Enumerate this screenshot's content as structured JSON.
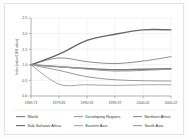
{
  "chart_data": {
    "type": "line",
    "title": "",
    "subtitle": "",
    "xlabel": "",
    "ylabel": "Index (value/1969 value)",
    "categories": [
      "1969-71",
      "1979-81",
      "1990-92",
      "1995-97",
      "2000-02",
      "2005-07"
    ],
    "xtick_labels": [
      "1969-71",
      "1979-81",
      "1990-92",
      "1995-97",
      "2000-02",
      "2005-07"
    ],
    "ytick_labels": [
      "0.0",
      "0.5",
      "1.0",
      "1.5",
      "2.0",
      "2.5"
    ],
    "ytick_values": [
      0.0,
      0.5,
      1.0,
      1.5,
      2.0,
      2.5
    ],
    "ylim": [
      0.0,
      2.5
    ],
    "grid": true,
    "legend_position": "bottom",
    "series": [
      {
        "name": "World",
        "color": "#7a7a7a",
        "width": 1.5,
        "values": [
          1.0,
          0.94,
          0.88,
          0.84,
          0.86,
          0.87
        ]
      },
      {
        "name": "Developing Regions",
        "color": "#9a9a9a",
        "width": 1.0,
        "values": [
          1.0,
          0.82,
          0.62,
          0.52,
          0.49,
          0.48
        ]
      },
      {
        "name": "Northern Africa",
        "color": "#8f8f8f",
        "width": 1.0,
        "values": [
          1.0,
          1.22,
          1.1,
          1.04,
          1.12,
          1.26
        ]
      },
      {
        "name": "Sub-Saharan Africa",
        "color": "#686868",
        "width": 1.4,
        "values": [
          1.0,
          1.34,
          1.78,
          1.98,
          2.12,
          2.12
        ]
      },
      {
        "name": "Eastern Asia",
        "color": "#a5a5a5",
        "width": 1.0,
        "values": [
          1.0,
          0.38,
          0.36,
          0.34,
          0.36,
          0.36
        ]
      },
      {
        "name": "South Asia",
        "color": "#9c9c9c",
        "width": 1.0,
        "values": [
          1.0,
          0.94,
          0.86,
          0.8,
          0.82,
          0.86
        ]
      }
    ]
  },
  "legend": {
    "entries": [
      {
        "label": "World",
        "color": "#7a7a7a"
      },
      {
        "label": "Developing Regions",
        "color": "#9a9a9a"
      },
      {
        "label": "Northern Africa",
        "color": "#8f8f8f"
      },
      {
        "label": "Sub-Saharan Africa",
        "color": "#686868"
      },
      {
        "label": "Eastern Asia",
        "color": "#a5a5a5"
      },
      {
        "label": "South Asia",
        "color": "#9c9c9c"
      }
    ]
  }
}
